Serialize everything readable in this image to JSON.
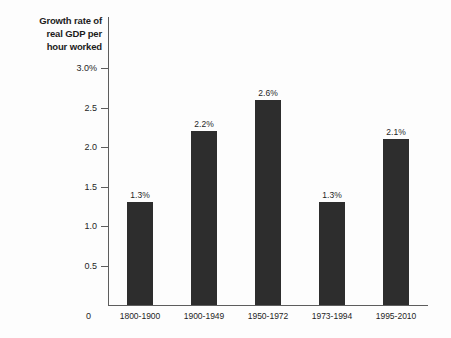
{
  "chart_data": {
    "type": "bar",
    "title": "Growth rate of real GDP per hour worked",
    "title_lines": [
      "Growth rate of",
      "real GDP per",
      "hour worked"
    ],
    "xlabel": "",
    "ylabel": "Growth rate of real GDP per hour worked",
    "categories": [
      "1800-1900",
      "1900-1949",
      "1950-1972",
      "1973-1994",
      "1995-2010"
    ],
    "values": [
      1.3,
      2.2,
      2.6,
      1.3,
      2.1
    ],
    "value_labels": [
      "1.3%",
      "2.2%",
      "2.6%",
      "1.3%",
      "2.1%"
    ],
    "ylim": [
      0,
      3.0
    ],
    "yticks": [
      3.0,
      2.5,
      2.0,
      1.5,
      1.0,
      0.5
    ],
    "ytick_labels": [
      "3.0%",
      "2.5",
      "2.0",
      "1.5",
      "1.0",
      "0.5"
    ],
    "origin_label": "0",
    "grid": false,
    "legend": null,
    "bar_color": "#2d2d2d",
    "axis_color": "#5d5d5d",
    "background": "#fdfdfd"
  }
}
